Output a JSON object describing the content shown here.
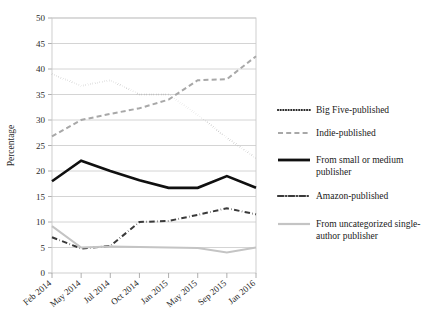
{
  "chart_data": {
    "type": "line",
    "title": "",
    "xlabel": "",
    "ylabel": "Percentage",
    "ylim": [
      0,
      50
    ],
    "ytick_step": 5,
    "yticks": [
      "0",
      "5",
      "10",
      "15",
      "20",
      "25",
      "30",
      "35",
      "40",
      "45",
      "50"
    ],
    "grid": true,
    "legend_position": "right",
    "categories": [
      "Feb 2014",
      "May 2014",
      "Jul 2014",
      "Oct 2014",
      "Jan 2015",
      "May 2015",
      "Sep 2015",
      "Jan 2016"
    ],
    "x_tick_labels": [
      "Feb 2014",
      "May 2014",
      "Jul 2014",
      "Oct 2014",
      "Jan 2015",
      "May 2015",
      "Sep 2015",
      "Jan 2016"
    ],
    "series": [
      {
        "name": "Big Five-published",
        "style": "dotted",
        "color": "#1d1d1d",
        "width": 2.0,
        "values": [
          39.0,
          36.7,
          37.8,
          35.0,
          35.0,
          31.0,
          26.5,
          22.5
        ]
      },
      {
        "name": "Indie-published",
        "style": "dashed",
        "color": "#a8a8a8",
        "width": 2.0,
        "values": [
          26.8,
          30.0,
          31.2,
          32.3,
          34.0,
          37.8,
          38.0,
          42.5
        ]
      },
      {
        "name": "From small or medium publisher",
        "style": "solid",
        "color": "#101010",
        "width": 2.6,
        "values": [
          18.0,
          22.0,
          20.0,
          18.2,
          16.7,
          16.7,
          19.0,
          16.7
        ]
      },
      {
        "name": "Amazon-published",
        "style": "dashdot",
        "color": "#3a3a3a",
        "width": 2.0,
        "values": [
          7.0,
          4.8,
          5.3,
          10.0,
          10.2,
          11.4,
          12.7,
          11.5
        ]
      },
      {
        "name": "From uncategorized single-author publisher",
        "style": "solid-light",
        "color": "#c4c4c4",
        "width": 2.0,
        "values": [
          9.2,
          5.0,
          5.2,
          5.1,
          5.0,
          4.9,
          4.0,
          5.0
        ]
      }
    ]
  },
  "legend": {
    "items": [
      {
        "label": "Big Five-published",
        "swatch": "dotted",
        "color": "#1d1d1d"
      },
      {
        "label": "Indie-published",
        "swatch": "dashed",
        "color": "#a8a8a8"
      },
      {
        "label": "From small or medium",
        "label2": "publisher",
        "swatch": "solid",
        "color": "#101010"
      },
      {
        "label": "Amazon-published",
        "swatch": "dashdot",
        "color": "#3a3a3a"
      },
      {
        "label": "From uncategorized single-",
        "label2": "author publisher",
        "swatch": "solid-light",
        "color": "#c4c4c4"
      }
    ]
  }
}
